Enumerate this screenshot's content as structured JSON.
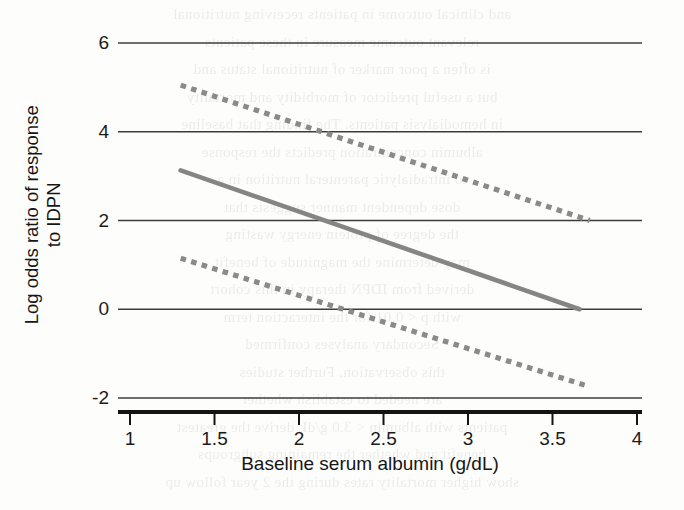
{
  "chart_data": {
    "type": "line",
    "title": "",
    "xlabel": "Baseline serum albumin (g/dL)",
    "ylabel": "Log odds ratio of response to IDPN",
    "ylabel_line1": "Log odds ratio of response",
    "ylabel_line2": "to IDPN",
    "xlim": [
      0.88,
      4.0
    ],
    "ylim": [
      -2.33,
      6.0
    ],
    "xticks": [
      1,
      1.5,
      2,
      2.5,
      3,
      3.5,
      4
    ],
    "xtick_labels": [
      "1",
      "1.5",
      "2",
      "2.5",
      "3",
      "3.5",
      "4"
    ],
    "yticks": [
      6,
      4,
      2,
      0,
      -2
    ],
    "ytick_labels": [
      "6",
      "4",
      "2",
      "0",
      "-2"
    ],
    "grid": "horizontal",
    "legend": "none",
    "series": [
      {
        "name": "upper-confidence-limit",
        "style": "dashed",
        "color": "#8a8a8a",
        "x": [
          1.3,
          3.72
        ],
        "y": [
          5.05,
          2.0
        ]
      },
      {
        "name": "fitted-log-odds-ratio",
        "style": "solid",
        "color": "#858585",
        "x": [
          1.3,
          3.66
        ],
        "y": [
          3.13,
          0.0
        ]
      },
      {
        "name": "lower-confidence-limit",
        "style": "dashed",
        "color": "#8a8a8a",
        "x": [
          1.3,
          3.69
        ],
        "y": [
          1.15,
          -1.71
        ]
      }
    ]
  },
  "colors": {
    "axis": "#141414",
    "gridline": "#3c3c3c",
    "line_gray": "#858585",
    "background": "#fdfdfc"
  },
  "bleed_text": {
    "lines": [
      "and clinical outcome in patients receiving nutritional",
      "relevant outcome measure in these patients",
      "is often a poor marker of nutritional status and",
      "but a useful predictor of morbidity and mortality",
      "in hemodialysis patients. The finding that baseline",
      "albumin concentration predicts the response",
      "to intradialytic parenteral nutrition in a",
      "dose dependent manner suggests that",
      "the degree of protein energy wasting",
      "may determine the magnitude of benefit",
      "derived from IDPN therapy in this cohort",
      "with p < 0.01 for the interaction term",
      "Secondary analyses confirmed",
      "this observation. Further studies",
      "are needed to establish whether",
      "patients with albumin < 3.0 g/dL derive the greatest",
      "benefit and whether the remaining subgroups",
      "show higher mortality rates during the 2 year follow up"
    ]
  }
}
